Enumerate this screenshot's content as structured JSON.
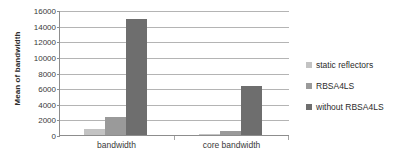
{
  "chart_data": {
    "type": "bar",
    "title": "",
    "xlabel": "",
    "ylabel": "Mean of bandwidth",
    "categories": [
      "bandwidth",
      "core bandwidth"
    ],
    "series": [
      {
        "name": "static reflectors",
        "values": [
          750,
          110
        ],
        "color": "#c3c3c3"
      },
      {
        "name": "RBSA4LS",
        "values": [
          2250,
          550
        ],
        "color": "#9a9a9a"
      },
      {
        "name": "without RBSA4LS",
        "values": [
          14850,
          6300
        ],
        "color": "#6e6e6e"
      }
    ],
    "ylim": [
      0,
      16000
    ],
    "yticks": [
      0,
      2000,
      4000,
      6000,
      8000,
      10000,
      12000,
      14000,
      16000
    ],
    "ytick_labels": [
      "0",
      "2000",
      "4000",
      "6000",
      "8000",
      "10000",
      "12000",
      "14000",
      "16000"
    ],
    "grid": true,
    "legend_position": "right"
  },
  "axis": {
    "y_title": "Mean of bandwidth"
  },
  "legend": {
    "items": [
      {
        "label": "static reflectors"
      },
      {
        "label": "RBSA4LS"
      },
      {
        "label": "without RBSA4LS"
      }
    ]
  }
}
